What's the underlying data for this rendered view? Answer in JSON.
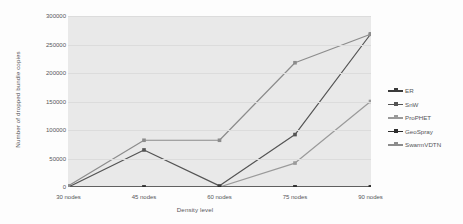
{
  "chart_data": {
    "type": "line",
    "title": "",
    "xlabel": "Density level",
    "ylabel": "Number of dropped bundle copies",
    "categories": [
      "30 nodes",
      "45 nodes",
      "60 nodes",
      "75 nodes",
      "90 nodes"
    ],
    "x": [
      30,
      45,
      60,
      75,
      90
    ],
    "ylim": [
      0,
      300000
    ],
    "yticks": [
      0,
      50000,
      100000,
      150000,
      200000,
      250000,
      300000
    ],
    "ytick_labels": [
      "0",
      "50000",
      "100000",
      "150000",
      "200000",
      "250000",
      "300000"
    ],
    "grid": true,
    "legend_position": "right",
    "series": [
      {
        "name": "ER",
        "color": "#3a3a3a",
        "values": [
          0,
          0,
          0,
          0,
          0
        ]
      },
      {
        "name": "SnW",
        "color": "#545454",
        "values": [
          0,
          65000,
          2000,
          92000,
          268000
        ]
      },
      {
        "name": "ProPHET",
        "color": "#9a9a9a",
        "values": [
          0,
          0,
          0,
          42000,
          150000
        ]
      },
      {
        "name": "GeoSpray",
        "color": "#2e2e2e",
        "values": [
          0,
          0,
          0,
          0,
          0
        ]
      },
      {
        "name": "SwarmVDTN",
        "color": "#8c8c8c",
        "values": [
          2000,
          82000,
          82000,
          218000,
          268000
        ]
      }
    ]
  },
  "legend": {
    "items": [
      {
        "label": "ER",
        "color": "#3a3a3a"
      },
      {
        "label": "SnW",
        "color": "#545454"
      },
      {
        "label": "ProPHET",
        "color": "#9a9a9a"
      },
      {
        "label": "GeoSpray",
        "color": "#2e2e2e"
      },
      {
        "label": "SwarmVDTN",
        "color": "#8c8c8c"
      }
    ]
  }
}
